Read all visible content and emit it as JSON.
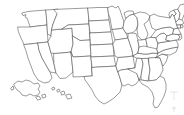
{
  "figure": {
    "type": "map",
    "projection": "albers-usa",
    "background_color": "#ffffff",
    "border_color": "#4a4a4a",
    "fill_color": "#ffffff",
    "labels_visible": false,
    "legend_visible": false
  },
  "map": {
    "region_count": 51,
    "insets": [
      {
        "name": "Alaska",
        "code": "AK",
        "position": "lower-left"
      },
      {
        "name": "Hawaii",
        "code": "HI",
        "position": "lower-left-center"
      }
    ],
    "states": [
      {
        "code": "AL",
        "name": "Alabama"
      },
      {
        "code": "AK",
        "name": "Alaska"
      },
      {
        "code": "AZ",
        "name": "Arizona"
      },
      {
        "code": "AR",
        "name": "Arkansas"
      },
      {
        "code": "CA",
        "name": "California"
      },
      {
        "code": "CO",
        "name": "Colorado"
      },
      {
        "code": "CT",
        "name": "Connecticut"
      },
      {
        "code": "DE",
        "name": "Delaware"
      },
      {
        "code": "FL",
        "name": "Florida"
      },
      {
        "code": "GA",
        "name": "Georgia"
      },
      {
        "code": "HI",
        "name": "Hawaii"
      },
      {
        "code": "ID",
        "name": "Idaho"
      },
      {
        "code": "IL",
        "name": "Illinois"
      },
      {
        "code": "IN",
        "name": "Indiana"
      },
      {
        "code": "IA",
        "name": "Iowa"
      },
      {
        "code": "KS",
        "name": "Kansas"
      },
      {
        "code": "KY",
        "name": "Kentucky"
      },
      {
        "code": "LA",
        "name": "Louisiana"
      },
      {
        "code": "ME",
        "name": "Maine"
      },
      {
        "code": "MD",
        "name": "Maryland"
      },
      {
        "code": "MA",
        "name": "Massachusetts"
      },
      {
        "code": "MI",
        "name": "Michigan"
      },
      {
        "code": "MN",
        "name": "Minnesota"
      },
      {
        "code": "MS",
        "name": "Mississippi"
      },
      {
        "code": "MO",
        "name": "Missouri"
      },
      {
        "code": "MT",
        "name": "Montana"
      },
      {
        "code": "NE",
        "name": "Nebraska"
      },
      {
        "code": "NV",
        "name": "Nevada"
      },
      {
        "code": "NH",
        "name": "New Hampshire"
      },
      {
        "code": "NJ",
        "name": "New Jersey"
      },
      {
        "code": "NM",
        "name": "New Mexico"
      },
      {
        "code": "NY",
        "name": "New York"
      },
      {
        "code": "NC",
        "name": "North Carolina"
      },
      {
        "code": "ND",
        "name": "North Dakota"
      },
      {
        "code": "OH",
        "name": "Ohio"
      },
      {
        "code": "OK",
        "name": "Oklahoma"
      },
      {
        "code": "OR",
        "name": "Oregon"
      },
      {
        "code": "PA",
        "name": "Pennsylvania"
      },
      {
        "code": "RI",
        "name": "Rhode Island"
      },
      {
        "code": "SC",
        "name": "South Carolina"
      },
      {
        "code": "SD",
        "name": "South Dakota"
      },
      {
        "code": "TN",
        "name": "Tennessee"
      },
      {
        "code": "TX",
        "name": "Texas"
      },
      {
        "code": "UT",
        "name": "Utah"
      },
      {
        "code": "VT",
        "name": "Vermont"
      },
      {
        "code": "VA",
        "name": "Virginia"
      },
      {
        "code": "WA",
        "name": "Washington"
      },
      {
        "code": "WV",
        "name": "West Virginia"
      },
      {
        "code": "WI",
        "name": "Wisconsin"
      },
      {
        "code": "WY",
        "name": "Wyoming"
      }
    ]
  }
}
